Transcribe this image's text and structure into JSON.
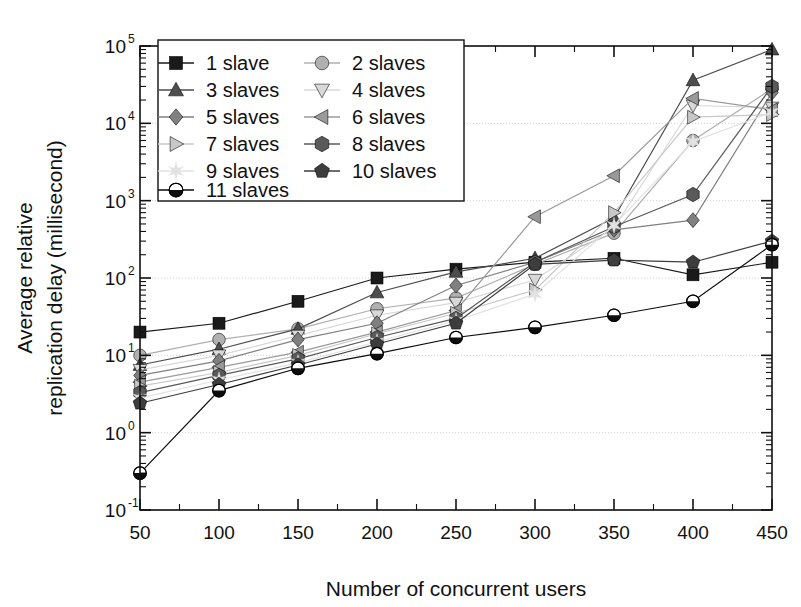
{
  "chart_data": {
    "type": "line",
    "title": "",
    "xlabel": "Number of concurrent users",
    "ylabel_line1": "Average relative",
    "ylabel_line2": "replication delay (millisecond)",
    "x": [
      50,
      100,
      150,
      200,
      250,
      300,
      350,
      400,
      450
    ],
    "xlim": [
      50,
      450
    ],
    "xticks": [
      "50",
      "100",
      "150",
      "200",
      "250",
      "300",
      "350",
      "400",
      "450"
    ],
    "ylim": [
      0.1,
      100000
    ],
    "yscale": "log",
    "yticks": [
      "10",
      "10",
      "10",
      "10",
      "10",
      "10",
      "10"
    ],
    "ytick_exponents": [
      "-1",
      "0",
      "1",
      "2",
      "3",
      "4",
      "5"
    ],
    "grid": true,
    "legend_position": "top-left",
    "series": [
      {
        "name": "1 slave",
        "marker": "square",
        "color": "#1a1a1a",
        "values": [
          20,
          26,
          50,
          100,
          130,
          160,
          180,
          110,
          160
        ]
      },
      {
        "name": "2 slaves",
        "marker": "circle",
        "color": "#b0b0b0",
        "values": [
          10,
          16,
          22,
          40,
          55,
          150,
          380,
          6000,
          28000
        ]
      },
      {
        "name": "3 slaves",
        "marker": "triangle-up",
        "color": "#4d4d4d",
        "values": [
          7.5,
          12,
          22,
          65,
          120,
          180,
          600,
          36000,
          90000
        ]
      },
      {
        "name": "4 slaves",
        "marker": "triangle-down",
        "color": "#d8d8d8",
        "values": [
          6.5,
          10,
          18,
          33,
          48,
          95,
          450,
          17000,
          16000
        ]
      },
      {
        "name": "5 slaves",
        "marker": "diamond",
        "color": "#808080",
        "values": [
          5.5,
          8.5,
          16,
          26,
          80,
          160,
          420,
          560,
          25000
        ]
      },
      {
        "name": "6 slaves",
        "marker": "triangle-left",
        "color": "#9a9a9a",
        "values": [
          4.5,
          7,
          11,
          20,
          38,
          620,
          2100,
          21000,
          15000
        ]
      },
      {
        "name": "7 slaves",
        "marker": "triangle-right",
        "color": "#c8c8c8",
        "values": [
          4,
          6,
          10,
          19,
          35,
          70,
          700,
          12000,
          13000
        ]
      },
      {
        "name": "8 slaves",
        "marker": "hexagon",
        "color": "#5a5a5a",
        "values": [
          3.3,
          5.5,
          9,
          17,
          30,
          160,
          460,
          1200,
          30000
        ]
      },
      {
        "name": "9 slaves",
        "marker": "star",
        "color": "#e2e2e2",
        "values": [
          2.8,
          4.8,
          8,
          15,
          28,
          62,
          480,
          5800,
          14000
        ]
      },
      {
        "name": "10 slaves",
        "marker": "pentagon",
        "color": "#3d3d3d",
        "values": [
          2.4,
          4.2,
          7.5,
          14,
          26,
          150,
          170,
          160,
          300
        ]
      },
      {
        "name": "11 slaves",
        "marker": "circle-half",
        "color": "#0d0d0d",
        "values": [
          0.3,
          3.5,
          6.8,
          10.5,
          17,
          23,
          33,
          50,
          270
        ]
      }
    ]
  },
  "legend": {
    "items": [
      {
        "label": "1 slave"
      },
      {
        "label": "2 slaves"
      },
      {
        "label": "3 slaves"
      },
      {
        "label": "4 slaves"
      },
      {
        "label": "5 slaves"
      },
      {
        "label": "6 slaves"
      },
      {
        "label": "7 slaves"
      },
      {
        "label": "8 slaves"
      },
      {
        "label": "9 slaves"
      },
      {
        "label": "10 slaves"
      },
      {
        "label": "11 slaves"
      }
    ]
  },
  "colors": {
    "axis": "#111111",
    "grid": "#cfcfcf",
    "background": "#ffffff"
  }
}
